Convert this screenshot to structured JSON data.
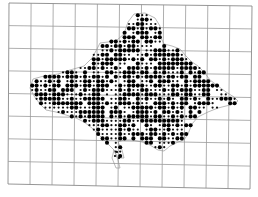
{
  "figure": {
    "kind": "dot distribution map",
    "width": 258,
    "height": 197
  },
  "grid": {
    "columns": 11,
    "rows": 8,
    "top_left": [
      9,
      3
    ],
    "top_right": [
      252,
      6
    ],
    "bottom_left": [
      8,
      184
    ],
    "bottom_right": [
      250,
      189
    ],
    "color": "#9a9a9a"
  },
  "landmass": {
    "outline": [
      [
        33,
        79
      ],
      [
        44,
        76
      ],
      [
        58,
        74
      ],
      [
        70,
        70
      ],
      [
        84,
        66
      ],
      [
        92,
        58
      ],
      [
        97,
        49
      ],
      [
        100,
        43
      ],
      [
        108,
        42
      ],
      [
        117,
        40
      ],
      [
        124,
        34
      ],
      [
        128,
        22
      ],
      [
        134,
        14
      ],
      [
        145,
        13
      ],
      [
        155,
        18
      ],
      [
        160,
        26
      ],
      [
        160,
        36
      ],
      [
        164,
        44
      ],
      [
        172,
        46
      ],
      [
        180,
        49
      ],
      [
        186,
        56
      ],
      [
        192,
        62
      ],
      [
        198,
        66
      ],
      [
        204,
        72
      ],
      [
        210,
        80
      ],
      [
        218,
        86
      ],
      [
        226,
        92
      ],
      [
        234,
        97
      ],
      [
        238,
        101
      ],
      [
        234,
        104
      ],
      [
        226,
        106
      ],
      [
        218,
        108
      ],
      [
        208,
        112
      ],
      [
        198,
        117
      ],
      [
        192,
        124
      ],
      [
        188,
        134
      ],
      [
        184,
        140
      ],
      [
        178,
        142
      ],
      [
        170,
        146
      ],
      [
        164,
        151
      ],
      [
        158,
        150
      ],
      [
        150,
        145
      ],
      [
        142,
        142
      ],
      [
        132,
        140
      ],
      [
        124,
        140
      ],
      [
        118,
        142
      ],
      [
        122,
        150
      ],
      [
        124,
        158
      ],
      [
        118,
        158
      ],
      [
        114,
        150
      ],
      [
        106,
        142
      ],
      [
        98,
        134
      ],
      [
        92,
        128
      ],
      [
        84,
        122
      ],
      [
        76,
        118
      ],
      [
        66,
        115
      ],
      [
        56,
        112
      ],
      [
        46,
        110
      ],
      [
        40,
        104
      ],
      [
        34,
        96
      ],
      [
        30,
        88
      ]
    ],
    "peninsula": [
      [
        114,
        150
      ],
      [
        118,
        160
      ],
      [
        120,
        168
      ],
      [
        116,
        168
      ],
      [
        112,
        158
      ]
    ],
    "dot_spacing": 4.4,
    "dot_color": "#000000",
    "big_dot_radius": 2.05,
    "small_dot_radius": 1.1,
    "big_dot_share": 0.62,
    "empty_share": 0.1,
    "seed": 1987
  }
}
